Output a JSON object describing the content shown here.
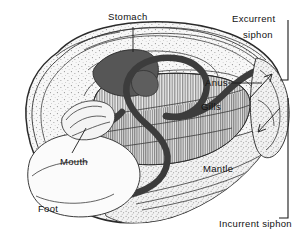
{
  "figure": {
    "background_color": "#ffffff",
    "ink_color": "#1a1a1a",
    "width": 305,
    "height": 242
  },
  "labels": {
    "stomach": "Stomach",
    "excurrent_siphon_line1": "Excurrent",
    "excurrent_siphon_line2": "siphon",
    "anus": "Anus",
    "gills": "Gills",
    "mantle": "Mantle",
    "mouth": "Mouth",
    "foot": "Foot",
    "incurrent_siphon": "Incurrent siphon"
  },
  "structures": [
    {
      "name": "shell",
      "fill": "#f4f4f4",
      "stroke": "#2a2a2a",
      "texture": "stipple"
    },
    {
      "name": "mantle",
      "fill": "#efefef",
      "stroke": "#333333",
      "texture": "stipple"
    },
    {
      "name": "gills",
      "fill": "#e2e2e2",
      "stroke": "#333333",
      "texture": "vertical-hatch"
    },
    {
      "name": "stomach",
      "fill": "#565656",
      "stroke": "#2a2a2a",
      "texture": "solid"
    },
    {
      "name": "intestine",
      "fill": "none",
      "stroke": "#4a4a4a",
      "texture": "solid-tube"
    },
    {
      "name": "foot",
      "fill": "#fbfbfb",
      "stroke": "#333333",
      "texture": "plain"
    },
    {
      "name": "labial-palps",
      "fill": "#f2f2f2",
      "stroke": "#333333",
      "texture": "plain"
    }
  ],
  "flow_arrows": [
    {
      "name": "excurrent-flow-arrow",
      "direction": "up-right",
      "meaning": "water out"
    },
    {
      "name": "incurrent-flow-arrow",
      "direction": "down-left",
      "meaning": "water in"
    }
  ]
}
